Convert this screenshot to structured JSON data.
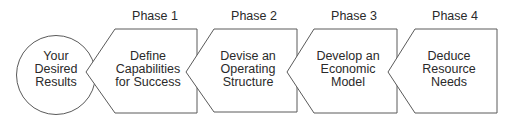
{
  "diagram": {
    "type": "process-flow",
    "direction": "right-to-left",
    "stroke_color": "#5a5a5a",
    "text_color": "#2a2a2a",
    "start": {
      "shape": "circle",
      "lines": [
        "Your",
        "Desired",
        "Results"
      ]
    },
    "phases": [
      {
        "label": "Phase 1",
        "shape": "left-pointing-pentagon",
        "lines": [
          "Define",
          "Capabilities",
          "for Success"
        ]
      },
      {
        "label": "Phase 2",
        "shape": "left-pointing-pentagon",
        "lines": [
          "Devise an",
          "Operating",
          "Structure"
        ]
      },
      {
        "label": "Phase 3",
        "shape": "left-pointing-pentagon",
        "lines": [
          "Develop an",
          "Economic",
          "Model"
        ]
      },
      {
        "label": "Phase 4",
        "shape": "left-pointing-pentagon",
        "lines": [
          "Deduce",
          "Resource",
          "Needs"
        ]
      }
    ]
  }
}
